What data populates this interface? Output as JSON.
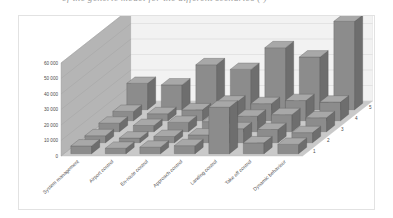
{
  "document_strip": {
    "cut_off_line": "of the generic model for the different scenarios (  )"
  },
  "figure": {
    "name": "3d-bar-chart-workload-per-task-and-scenario"
  },
  "chart_data": {
    "type": "bar",
    "subtype": "3d-column",
    "title": "",
    "xlabel": "",
    "ylabel": "",
    "zlabel": "Scen [FO]",
    "grid": true,
    "legend_position": "none",
    "ylim": [
      0,
      60000
    ],
    "yticks": [
      0,
      10000,
      20000,
      30000,
      40000,
      50000,
      60000
    ],
    "ytick_labels": [
      "0",
      "10 000",
      "20 000",
      "30 000",
      "40 000",
      "50 000",
      "60 000"
    ],
    "categories": [
      "System management",
      "Airport control",
      "En-route control",
      "Approach control",
      "Landing control",
      "Take off control",
      "Dynamic behaviour"
    ],
    "depth_categories": [
      "1",
      "2",
      "3",
      "4",
      "5"
    ],
    "depth_tick_labels": [
      "1",
      "2",
      "3",
      "4",
      "5"
    ],
    "bar_color": "#8c8c8c",
    "bar_top_color": "#a8a8a8",
    "bar_side_color": "#6e6e6e",
    "floor_color": "#c9c9c9",
    "back_wall_color": "#b5b5b5",
    "series": [
      {
        "name": "1",
        "values": [
          5000,
          3500,
          4200,
          5200,
          30000,
          7000,
          6000
        ]
      },
      {
        "name": "2",
        "values": [
          4500,
          3000,
          4000,
          5000,
          9000,
          8500,
          6500
        ]
      },
      {
        "name": "3",
        "values": [
          5500,
          4000,
          6000,
          6500,
          10000,
          11000,
          9000
        ]
      },
      {
        "name": "4",
        "values": [
          6000,
          4500,
          7000,
          12000,
          11000,
          13000,
          12000
        ]
      },
      {
        "name": "5",
        "values": [
          17000,
          16000,
          29000,
          26000,
          40000,
          34000,
          57000
        ]
      }
    ],
    "series_back_to_front": [
      {
        "name": "5",
        "values": [
          17000,
          16000,
          29000,
          26000,
          40000,
          34000,
          57000
        ]
      },
      {
        "name": "4",
        "values": [
          6000,
          4500,
          7000,
          12000,
          11000,
          13000,
          12000
        ]
      },
      {
        "name": "3",
        "values": [
          5500,
          4000,
          6000,
          6500,
          10000,
          11000,
          9000
        ]
      },
      {
        "name": "2",
        "values": [
          4500,
          3000,
          4000,
          5000,
          9000,
          8500,
          6500
        ]
      },
      {
        "name": "1",
        "values": [
          5000,
          3500,
          4200,
          5200,
          30000,
          7000,
          6000
        ]
      }
    ]
  }
}
